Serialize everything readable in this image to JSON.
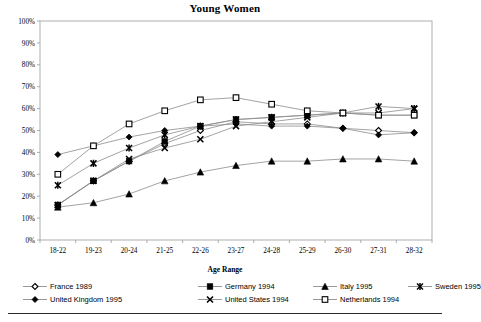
{
  "chart_data": {
    "type": "line",
    "title": "Young Women",
    "xlabel": "Age Range",
    "ylabel": "",
    "grid": false,
    "legend_position": "bottom",
    "ylim": [
      0,
      100
    ],
    "ytick_labels": [
      "0%",
      "10%",
      "20%",
      "30%",
      "40%",
      "50%",
      "60%",
      "70%",
      "80%",
      "90%",
      "100%"
    ],
    "ytick_values": [
      0,
      10,
      20,
      30,
      40,
      50,
      60,
      70,
      80,
      90,
      100
    ],
    "categories": [
      "18-22",
      "19-23",
      "20-24",
      "21-25",
      "22-26",
      "23-27",
      "24-28",
      "25-29",
      "26-30",
      "27-31",
      "28-32"
    ],
    "series": [
      {
        "name": "France 1989",
        "marker": "diamond-open",
        "values": [
          16,
          27,
          36,
          44,
          50,
          54,
          53,
          53,
          51,
          50,
          49
        ]
      },
      {
        "name": "Germany 1994",
        "marker": "square-filled",
        "values": [
          16,
          27,
          36,
          45,
          52,
          55,
          56,
          57,
          58,
          57,
          57
        ]
      },
      {
        "name": "Italy 1995",
        "marker": "triangle-filled",
        "values": [
          15,
          17,
          21,
          27,
          31,
          34,
          36,
          36,
          37,
          37,
          36
        ]
      },
      {
        "name": "Sweden 1995",
        "marker": "asterisk",
        "values": [
          25,
          35,
          42,
          48,
          52,
          55,
          56,
          57,
          58,
          61,
          60
        ]
      },
      {
        "name": "United Kingdom 1995",
        "marker": "diamond-filled",
        "values": [
          39,
          43,
          47,
          50,
          52,
          53,
          52,
          52,
          51,
          48,
          49
        ]
      },
      {
        "name": "United States 1994",
        "marker": "cross-x",
        "values": [
          16,
          27,
          37,
          42,
          46,
          52,
          54,
          56,
          58,
          58,
          60
        ]
      },
      {
        "name": "Netherlands 1994",
        "marker": "square-open",
        "values": [
          30,
          43,
          53,
          59,
          64,
          65,
          62,
          59,
          58,
          57,
          57
        ]
      }
    ]
  },
  "legend": {
    "rows": [
      [
        {
          "label": "France 1989",
          "marker": "diamond-open"
        },
        {
          "label": "Germany 1994",
          "marker": "square-filled"
        },
        {
          "label": "Italy 1995",
          "marker": "triangle-filled"
        },
        {
          "label": "Sweden 1995",
          "marker": "asterisk"
        }
      ],
      [
        {
          "label": "United Kingdom 1995",
          "marker": "diamond-filled"
        },
        {
          "label": "United States 1994",
          "marker": "cross-x"
        },
        {
          "label": "Netherlands 1994",
          "marker": "square-open"
        }
      ]
    ]
  },
  "colors": {
    "line": "#8c8c8c",
    "marker": "#000000",
    "axis": "#9a9a9a",
    "text": "#000000",
    "background": "#ffffff"
  }
}
